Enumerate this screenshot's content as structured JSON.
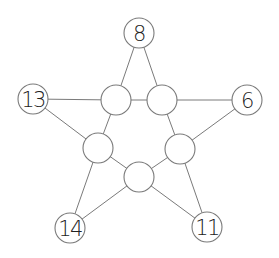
{
  "diagram": {
    "type": "star-graph",
    "colors": {
      "stroke": "#7a7a7a",
      "text": "#222222",
      "background": "#ffffff"
    },
    "node_radius": 15,
    "outer_nodes": [
      {
        "id": "top",
        "label": "8",
        "cx": 139,
        "cy": 33
      },
      {
        "id": "left",
        "label": "13",
        "cx": 33,
        "cy": 99
      },
      {
        "id": "right",
        "label": "6",
        "cx": 247,
        "cy": 100
      },
      {
        "id": "bottom-left",
        "label": "14",
        "cx": 70,
        "cy": 228
      },
      {
        "id": "bottom-right",
        "label": "11",
        "cx": 207,
        "cy": 227
      }
    ],
    "inner_nodes": [
      {
        "id": "inner-top-left",
        "label": "",
        "cx": 116,
        "cy": 100
      },
      {
        "id": "inner-top-right",
        "label": "",
        "cx": 162,
        "cy": 100
      },
      {
        "id": "inner-left",
        "label": "",
        "cx": 98,
        "cy": 148
      },
      {
        "id": "inner-right",
        "label": "",
        "cx": 180,
        "cy": 149
      },
      {
        "id": "inner-bottom",
        "label": "",
        "cx": 139,
        "cy": 177
      }
    ],
    "edges": [
      [
        "top",
        "inner-top-left"
      ],
      [
        "top",
        "inner-top-right"
      ],
      [
        "left",
        "inner-top-left"
      ],
      [
        "left",
        "inner-left"
      ],
      [
        "right",
        "inner-top-right"
      ],
      [
        "right",
        "inner-right"
      ],
      [
        "bottom-left",
        "inner-left"
      ],
      [
        "bottom-left",
        "inner-bottom"
      ],
      [
        "bottom-right",
        "inner-right"
      ],
      [
        "bottom-right",
        "inner-bottom"
      ],
      [
        "inner-top-left",
        "inner-top-right"
      ],
      [
        "inner-top-left",
        "inner-left"
      ],
      [
        "inner-top-right",
        "inner-right"
      ],
      [
        "inner-left",
        "inner-bottom"
      ],
      [
        "inner-right",
        "inner-bottom"
      ]
    ]
  }
}
